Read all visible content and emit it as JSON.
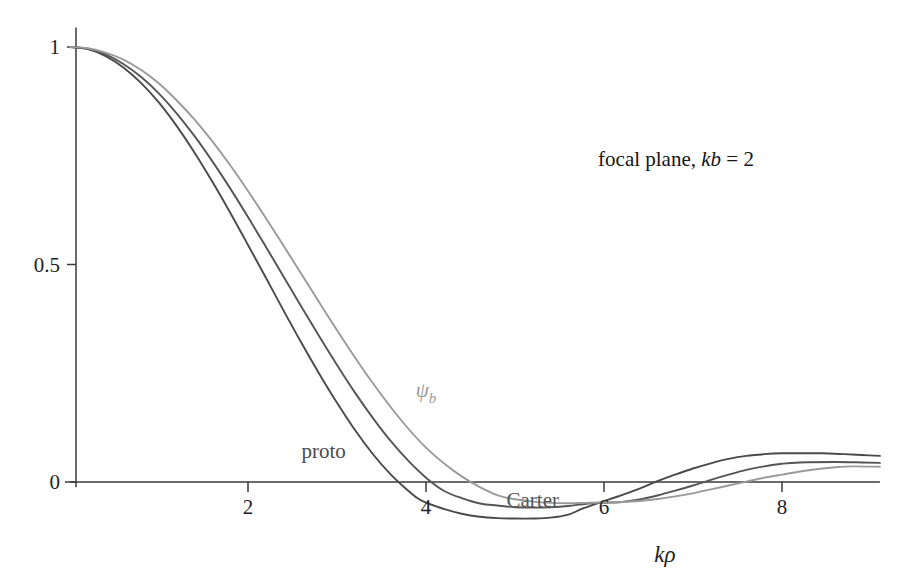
{
  "figure": {
    "background_color": "#ffffff",
    "axis_color": "#3a3a3a"
  },
  "chart_data": {
    "type": "line",
    "title": "",
    "annotation": {
      "text_plain": "focal plane, kb = 2",
      "parts": [
        {
          "text": "focal plane, ",
          "style": "roman"
        },
        {
          "text": "kb",
          "style": "italic"
        },
        {
          "text": " = 2",
          "style": "roman"
        }
      ],
      "x": 0.0,
      "y": 0.0
    },
    "xlabel": "kρ",
    "ylabel": "",
    "xlim": [
      0,
      9.1
    ],
    "ylim": [
      -0.085,
      1.05
    ],
    "xticks": [
      2,
      4,
      6,
      8
    ],
    "xtick_labels": [
      "2",
      "4",
      "6",
      "8"
    ],
    "yticks": [
      0,
      0.5,
      1
    ],
    "ytick_labels": [
      "0",
      "0.5",
      "1"
    ],
    "grid": false,
    "legend": "inline-labels",
    "series": [
      {
        "name": "proto",
        "label": "proto",
        "color": "#4a4a4a",
        "linewidth": 1.9,
        "label_x": 2.85,
        "label_y": 0.055,
        "zero_crossing": 3.95,
        "minimum": {
          "x": 5.75,
          "y": -0.062
        },
        "maximum_second": {
          "x": 8.45,
          "y": 0.066
        },
        "x": [
          0,
          0.2,
          0.4,
          0.6,
          0.8,
          1.0,
          1.2,
          1.4,
          1.6,
          1.8,
          2.0,
          2.2,
          2.4,
          2.6,
          2.8,
          3.0,
          3.2,
          3.4,
          3.6,
          3.8,
          3.95,
          4.2,
          4.4,
          4.6,
          4.8,
          5.0,
          5.2,
          5.4,
          5.6,
          5.75,
          6.0,
          6.2,
          6.4,
          6.6,
          6.8,
          7.0,
          7.2,
          7.4,
          7.6,
          7.8,
          8.0,
          8.2,
          8.45,
          8.7,
          8.9,
          9.1
        ],
        "y": [
          1.0,
          0.995,
          0.979,
          0.953,
          0.917,
          0.872,
          0.818,
          0.757,
          0.69,
          0.619,
          0.545,
          0.47,
          0.394,
          0.32,
          0.249,
          0.182,
          0.12,
          0.065,
          0.018,
          -0.02,
          -0.043,
          -0.062,
          -0.073,
          -0.08,
          -0.083,
          -0.084,
          -0.084,
          -0.082,
          -0.075,
          -0.062,
          -0.044,
          -0.03,
          -0.015,
          0.002,
          0.017,
          0.031,
          0.043,
          0.053,
          0.06,
          0.064,
          0.066,
          0.066,
          0.066,
          0.064,
          0.062,
          0.06
        ]
      },
      {
        "name": "Carter",
        "label": "Carter",
        "color": "#555555",
        "linewidth": 1.9,
        "label_x": 5.2,
        "label_y": -0.058,
        "zero_crossing": 4.62,
        "minimum": {
          "x": 6.2,
          "y": -0.046
        },
        "maximum_second": {
          "x": 8.6,
          "y": 0.046
        },
        "x": [
          0,
          0.2,
          0.4,
          0.6,
          0.8,
          1.0,
          1.2,
          1.4,
          1.6,
          1.8,
          2.0,
          2.2,
          2.4,
          2.6,
          2.8,
          3.0,
          3.2,
          3.4,
          3.6,
          3.8,
          4.0,
          4.2,
          4.4,
          4.62,
          4.8,
          5.0,
          5.2,
          5.4,
          5.6,
          5.8,
          6.0,
          6.2,
          6.4,
          6.6,
          6.8,
          7.0,
          7.2,
          7.4,
          7.6,
          7.8,
          8.0,
          8.2,
          8.6,
          8.9,
          9.1
        ],
        "y": [
          1.0,
          0.996,
          0.983,
          0.961,
          0.931,
          0.893,
          0.847,
          0.795,
          0.737,
          0.675,
          0.609,
          0.541,
          0.472,
          0.403,
          0.335,
          0.269,
          0.206,
          0.148,
          0.095,
          0.049,
          0.01,
          -0.02,
          -0.037,
          -0.05,
          -0.054,
          -0.058,
          -0.059,
          -0.058,
          -0.055,
          -0.05,
          -0.048,
          -0.046,
          -0.04,
          -0.031,
          -0.02,
          -0.008,
          0.005,
          0.017,
          0.028,
          0.036,
          0.042,
          0.045,
          0.046,
          0.045,
          0.044
        ]
      },
      {
        "name": "psi_b",
        "label": "ψb",
        "color": "#9a9a9a",
        "linewidth": 1.9,
        "label_x": 4.0,
        "label_y": 0.195,
        "zero_crossing": 4.95,
        "minimum": {
          "x": 6.3,
          "y": -0.045
        },
        "maximum_second": {
          "x": 8.8,
          "y": 0.036
        },
        "x": [
          0,
          0.2,
          0.4,
          0.6,
          0.8,
          1.0,
          1.2,
          1.4,
          1.6,
          1.8,
          2.0,
          2.2,
          2.4,
          2.6,
          2.8,
          3.0,
          3.2,
          3.4,
          3.6,
          3.8,
          4.0,
          4.2,
          4.4,
          4.6,
          4.8,
          4.95,
          5.2,
          5.4,
          5.6,
          5.8,
          6.0,
          6.3,
          6.6,
          6.8,
          7.0,
          7.2,
          7.4,
          7.6,
          7.8,
          8.0,
          8.3,
          8.6,
          8.8,
          9.1
        ],
        "y": [
          1.0,
          0.997,
          0.987,
          0.971,
          0.947,
          0.916,
          0.877,
          0.833,
          0.783,
          0.728,
          0.669,
          0.607,
          0.543,
          0.478,
          0.413,
          0.349,
          0.287,
          0.228,
          0.173,
          0.123,
          0.079,
          0.043,
          0.013,
          -0.011,
          -0.03,
          -0.038,
          -0.045,
          -0.048,
          -0.049,
          -0.048,
          -0.047,
          -0.045,
          -0.039,
          -0.033,
          -0.026,
          -0.017,
          -0.008,
          0.001,
          0.01,
          0.017,
          0.027,
          0.034,
          0.036,
          0.035
        ]
      }
    ]
  }
}
